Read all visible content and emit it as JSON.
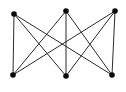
{
  "diagram": {
    "background_color": "#ffffff",
    "edge_color": "#2b2b2b",
    "edge_width": 1,
    "vertex_color": "#0a0a0a",
    "vertex_radius": 2.8,
    "vertices": [
      {
        "id": "top-left",
        "x": 14,
        "y": 14
      },
      {
        "id": "top-middle",
        "x": 66,
        "y": 11
      },
      {
        "id": "top-right",
        "x": 115,
        "y": 11
      },
      {
        "id": "bottom-left",
        "x": 13,
        "y": 75
      },
      {
        "id": "bottom-middle",
        "x": 66,
        "y": 76
      },
      {
        "id": "bottom-right",
        "x": 112,
        "y": 75
      }
    ],
    "edges": [
      [
        "top-left",
        "bottom-left"
      ],
      [
        "top-left",
        "bottom-middle"
      ],
      [
        "top-left",
        "bottom-right"
      ],
      [
        "top-middle",
        "bottom-left"
      ],
      [
        "top-middle",
        "bottom-middle"
      ],
      [
        "top-middle",
        "bottom-right"
      ],
      [
        "top-right",
        "bottom-left"
      ],
      [
        "top-right",
        "bottom-middle"
      ],
      [
        "top-right",
        "bottom-right"
      ]
    ]
  }
}
